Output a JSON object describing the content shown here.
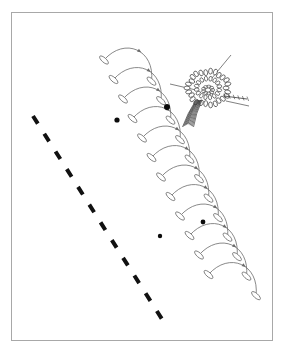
{
  "figure": {
    "background_color": "#ffffff",
    "frame": {
      "name": "figure-border",
      "x": 11,
      "y": 12,
      "width": 262,
      "height": 329,
      "stroke_color": "#a8a8a8",
      "stroke_width": 1,
      "fill_color": "#ffffff"
    },
    "ink_color": "#5a5a5a",
    "dark_ink_color": "#1a1a1a"
  },
  "dashed_line": {
    "name": "dashed-reference-line",
    "stroke_color": "#111111",
    "stroke_width": 4,
    "dash_pattern": "9 12",
    "angle_degrees": 62,
    "start": {
      "x": 33,
      "y": 116
    },
    "end": {
      "x": 167,
      "y": 327
    },
    "dash_count": 10
  },
  "arc_chain": {
    "name": "helical-arc-chain",
    "description": "Chain of semicircular arcs forming a descending helix, each arc terminated by a slender ellipse marker and bearing a small arrowhead near its apex",
    "arc_count": 12,
    "stroke_color": "#6b6b6b",
    "stroke_width": 0.8,
    "marker_shape": "slender-ellipse",
    "marker_rx": 2.2,
    "marker_ry": 5.6,
    "start": {
      "x": 104,
      "y": 60
    },
    "end": {
      "x": 216,
      "y": 280
    },
    "step_x": 9.5,
    "step_y": 19.5,
    "arc_span_x": 52,
    "arc_height": 30,
    "arc_tilt_degrees": 24
  },
  "markers": {
    "name": "solid-point-markers",
    "color": "#0b0b0b",
    "points": [
      {
        "label": "marker-a",
        "x": 167,
        "y": 107,
        "r": 3.0
      },
      {
        "label": "marker-b",
        "x": 117,
        "y": 120,
        "r": 2.6
      },
      {
        "label": "marker-c",
        "x": 203,
        "y": 222,
        "r": 2.4
      },
      {
        "label": "marker-d",
        "x": 160,
        "y": 236,
        "r": 2.2
      }
    ]
  },
  "flower": {
    "name": "thistle-flower-head",
    "center": {
      "x": 208,
      "y": 88
    },
    "outer_radius": 20,
    "inner_radius": 11,
    "bract_count": 26,
    "stroke_color": "#3a3a3a",
    "tassel": {
      "name": "flower-tassel",
      "origin": {
        "x": 199,
        "y": 100
      },
      "tip": {
        "x": 188,
        "y": 124
      },
      "strand_count": 11
    },
    "style_spike": {
      "name": "flower-style-spike",
      "origin": {
        "x": 224,
        "y": 96
      },
      "tip": {
        "x": 247,
        "y": 99
      },
      "tick_count": 6
    }
  },
  "leader_lines": {
    "name": "annotation-leader-lines",
    "stroke_color": "#4a4a4a",
    "stroke_width": 0.7,
    "lines": [
      {
        "label": "leader-upper-right",
        "x1": 231,
        "y1": 55,
        "x2": 212,
        "y2": 78
      },
      {
        "label": "leader-left",
        "x1": 170,
        "y1": 84,
        "x2": 196,
        "y2": 90
      },
      {
        "label": "leader-lower-right",
        "x1": 226,
        "y1": 101,
        "x2": 249,
        "y2": 106
      }
    ]
  }
}
